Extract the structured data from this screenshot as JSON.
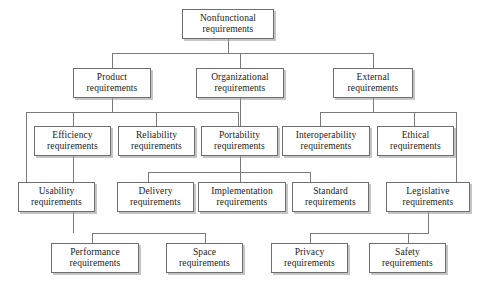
{
  "diagram": {
    "type": "tree",
    "line_color": "#7a7a7a",
    "box_border_color": "#6e6e6e",
    "box_fill_color": "#ffffff",
    "text_color": "#1a1a1a",
    "nodes": [
      {
        "id": "nonfunctional",
        "line1": "Nonfunctional",
        "line2": "requirements",
        "x": 182,
        "y": 9,
        "w": 92,
        "h": 30
      },
      {
        "id": "product",
        "line1": "Product",
        "line2": "requirements",
        "x": 73,
        "y": 68,
        "w": 78,
        "h": 30
      },
      {
        "id": "organizational",
        "line1": "Organizational",
        "line2": "requirements",
        "x": 196,
        "y": 68,
        "w": 88,
        "h": 30
      },
      {
        "id": "external",
        "line1": "External",
        "line2": "requirements",
        "x": 333,
        "y": 68,
        "w": 80,
        "h": 30
      },
      {
        "id": "efficiency",
        "line1": "Efficiency",
        "line2": "requirements",
        "x": 34,
        "y": 126,
        "w": 77,
        "h": 30
      },
      {
        "id": "reliability",
        "line1": "Reliability",
        "line2": "requirements",
        "x": 118,
        "y": 126,
        "w": 77,
        "h": 30
      },
      {
        "id": "portability",
        "line1": "Portability",
        "line2": "requirements",
        "x": 201,
        "y": 126,
        "w": 77,
        "h": 30
      },
      {
        "id": "interoperability",
        "line1": "Interoperability",
        "line2": "requirements",
        "x": 282,
        "y": 126,
        "w": 88,
        "h": 30
      },
      {
        "id": "ethical",
        "line1": "Ethical",
        "line2": "requirements",
        "x": 377,
        "y": 126,
        "w": 77,
        "h": 30
      },
      {
        "id": "usability",
        "line1": "Usability",
        "line2": "requirements",
        "x": 18,
        "y": 182,
        "w": 77,
        "h": 30
      },
      {
        "id": "delivery",
        "line1": "Delivery",
        "line2": "requirements",
        "x": 117,
        "y": 182,
        "w": 77,
        "h": 30
      },
      {
        "id": "implementation",
        "line1": "Implementation",
        "line2": "requirements",
        "x": 198,
        "y": 182,
        "w": 88,
        "h": 30
      },
      {
        "id": "standard",
        "line1": "Standard",
        "line2": "requirements",
        "x": 292,
        "y": 182,
        "w": 77,
        "h": 30
      },
      {
        "id": "legislative",
        "line1": "Legislative",
        "line2": "requirements",
        "x": 386,
        "y": 182,
        "w": 84,
        "h": 30
      },
      {
        "id": "performance",
        "line1": "Performance",
        "line2": "requirements",
        "x": 51,
        "y": 243,
        "w": 88,
        "h": 30
      },
      {
        "id": "space",
        "line1": "Space",
        "line2": "requirements",
        "x": 166,
        "y": 243,
        "w": 77,
        "h": 30
      },
      {
        "id": "privacy",
        "line1": "Privacy",
        "line2": "requirements",
        "x": 271,
        "y": 243,
        "w": 77,
        "h": 30
      },
      {
        "id": "safety",
        "line1": "Safety",
        "line2": "requirements",
        "x": 369,
        "y": 243,
        "w": 77,
        "h": 30
      }
    ],
    "edges": [
      {
        "id": "root-stem",
        "orient": "v",
        "x": 228,
        "y": 39,
        "len": 14
      },
      {
        "id": "root-bus",
        "orient": "h",
        "x": 112,
        "y": 53,
        "len": 261
      },
      {
        "id": "drop-product",
        "orient": "v",
        "x": 112,
        "y": 53,
        "len": 15
      },
      {
        "id": "drop-organizational",
        "orient": "v",
        "x": 240,
        "y": 53,
        "len": 15
      },
      {
        "id": "drop-external",
        "orient": "v",
        "x": 373,
        "y": 53,
        "len": 15
      },
      {
        "id": "product-stem",
        "orient": "v",
        "x": 112,
        "y": 98,
        "len": 14
      },
      {
        "id": "product-bus",
        "orient": "h",
        "x": 26,
        "y": 112,
        "len": 212
      },
      {
        "id": "drop-usability-long",
        "orient": "v",
        "x": 26,
        "y": 112,
        "len": 70
      },
      {
        "id": "drop-efficiency",
        "orient": "v",
        "x": 73,
        "y": 112,
        "len": 14
      },
      {
        "id": "drop-reliability",
        "orient": "v",
        "x": 156,
        "y": 112,
        "len": 14
      },
      {
        "id": "drop-portability",
        "orient": "v",
        "x": 238,
        "y": 112,
        "len": 14
      },
      {
        "id": "organizational-stem",
        "orient": "v",
        "x": 240,
        "y": 98,
        "len": 74
      },
      {
        "id": "organizational-bus",
        "orient": "h",
        "x": 148,
        "y": 172,
        "len": 162
      },
      {
        "id": "drop-delivery",
        "orient": "v",
        "x": 148,
        "y": 172,
        "len": 10
      },
      {
        "id": "drop-implementation",
        "orient": "v",
        "x": 240,
        "y": 172,
        "len": 10
      },
      {
        "id": "drop-standard",
        "orient": "v",
        "x": 310,
        "y": 172,
        "len": 10
      },
      {
        "id": "external-stem",
        "orient": "v",
        "x": 373,
        "y": 98,
        "len": 14
      },
      {
        "id": "external-bus",
        "orient": "h",
        "x": 320,
        "y": 112,
        "len": 136
      },
      {
        "id": "drop-interoperability",
        "orient": "v",
        "x": 320,
        "y": 112,
        "len": 14
      },
      {
        "id": "drop-ethical",
        "orient": "v",
        "x": 414,
        "y": 112,
        "len": 14
      },
      {
        "id": "drop-legislative-long",
        "orient": "v",
        "x": 456,
        "y": 112,
        "len": 70
      },
      {
        "id": "efficiency-stem",
        "orient": "v",
        "x": 73,
        "y": 156,
        "len": 77
      },
      {
        "id": "efficiency-bus",
        "orient": "h",
        "x": 92,
        "y": 233,
        "len": 113
      },
      {
        "id": "drop-performance",
        "orient": "v",
        "x": 92,
        "y": 233,
        "len": 10
      },
      {
        "id": "drop-space",
        "orient": "v",
        "x": 205,
        "y": 233,
        "len": 10
      },
      {
        "id": "legislative-stem",
        "orient": "v",
        "x": 428,
        "y": 212,
        "len": 21
      },
      {
        "id": "legislative-bus",
        "orient": "h",
        "x": 310,
        "y": 233,
        "len": 119
      },
      {
        "id": "drop-privacy",
        "orient": "v",
        "x": 310,
        "y": 233,
        "len": 10
      },
      {
        "id": "drop-safety",
        "orient": "v",
        "x": 408,
        "y": 233,
        "len": 10
      }
    ]
  }
}
